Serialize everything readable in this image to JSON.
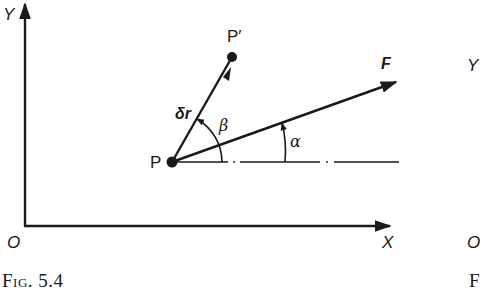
{
  "figure": {
    "caption": "Fig. 5.4",
    "axes": {
      "y_label": "Y",
      "x_label": "X",
      "origin_label": "O"
    },
    "points": {
      "p": "P",
      "p_prime": "P′"
    },
    "vectors": {
      "displacement": "δr",
      "force": "F"
    },
    "angles": {
      "beta": "β",
      "alpha": "α"
    }
  },
  "next_figure_partial": {
    "y_label": "Y",
    "origin_label": "O",
    "caption": "F"
  },
  "colors": {
    "ink": "#1a1a1a",
    "background": "#ffffff"
  }
}
